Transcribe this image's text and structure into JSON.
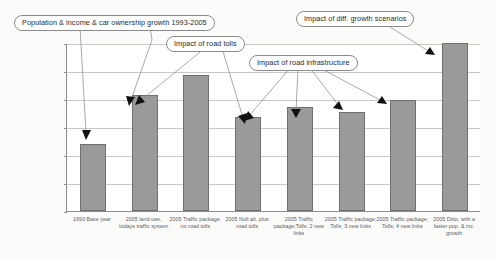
{
  "chart_data": {
    "type": "bar",
    "title": "",
    "xlabel": "",
    "ylabel": "",
    "ylim": [
      16000000,
      22000000
    ],
    "ystep": 1000000,
    "grid": true,
    "legend": "none",
    "bar_color": "#9a9a9a",
    "tick_labels": [
      "22 000 000",
      "21 000 000",
      "20 000 000",
      "19 000 000",
      "18 000 000",
      "17 000 000",
      "16 000 000"
    ],
    "tick_values": [
      22000000,
      21000000,
      20000000,
      19000000,
      18000000,
      17000000,
      16000000
    ],
    "categories": [
      "1993 Base year",
      "2005 land-use, todays traffic system",
      "2005 Traffic package, no road tolls",
      "2005 Null alt. plus road tolls",
      "2005 Traffic package;Tolls; 2 new links",
      "2005 Traffic package; Tolls; 3 new links",
      "2005 Traffic package; Tolls; 4 new links",
      "2005 Ditto, with a faster pop. & inc. growth"
    ],
    "values": [
      18400000,
      20150000,
      20870000,
      19350000,
      19700000,
      19550000,
      19950000,
      22000000
    ],
    "annotations": [
      "Population & income & car ownership growth 1993-2005",
      "Impact of road tolls",
      "Impact of road infrastructure",
      "Impact of diff. growth scenarios"
    ]
  },
  "callouts": {
    "growth": "Population & income & car ownership growth 1993-2005",
    "tolls": "Impact of road tolls",
    "infrastructure": "Impact of road infrastructure",
    "scenarios": "Impact of diff. growth scenarios"
  }
}
